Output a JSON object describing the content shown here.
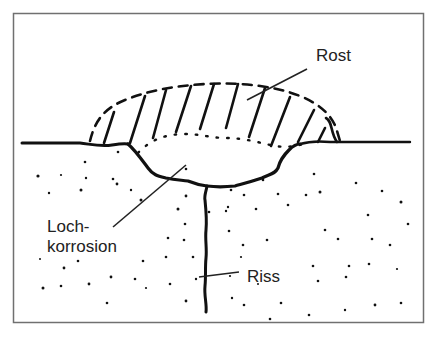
{
  "diagram": {
    "type": "cross-section illustration",
    "labels": {
      "rust": "Rost",
      "pitting_line1": "Loch-",
      "pitting_line2": "korrosion",
      "crack": "Riss"
    },
    "colors": {
      "background": "#ffffff",
      "frame": "#707070",
      "ink": "#111111",
      "text": "#222222"
    }
  }
}
